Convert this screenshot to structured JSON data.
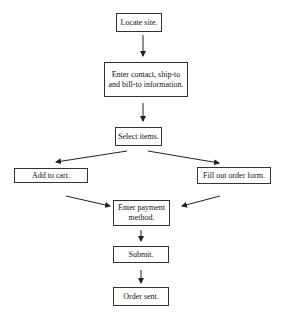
{
  "diagram": {
    "type": "flowchart",
    "nodes": [
      {
        "id": "locate",
        "label": "Locate site."
      },
      {
        "id": "enter_contact",
        "label": "Enter contact, ship-to and bill-to information."
      },
      {
        "id": "select",
        "label": "Select items."
      },
      {
        "id": "add_cart",
        "label": "Add to cart."
      },
      {
        "id": "fill_form",
        "label": "Fill out order form."
      },
      {
        "id": "payment",
        "label": "Enter payment method."
      },
      {
        "id": "submit",
        "label": "Submit."
      },
      {
        "id": "sent",
        "label": "Order sent."
      }
    ],
    "edges": [
      {
        "from": "locate",
        "to": "enter_contact"
      },
      {
        "from": "enter_contact",
        "to": "select"
      },
      {
        "from": "select",
        "to": "add_cart"
      },
      {
        "from": "select",
        "to": "fill_form"
      },
      {
        "from": "add_cart",
        "to": "payment"
      },
      {
        "from": "fill_form",
        "to": "payment"
      },
      {
        "from": "payment",
        "to": "submit"
      },
      {
        "from": "submit",
        "to": "sent"
      }
    ]
  }
}
